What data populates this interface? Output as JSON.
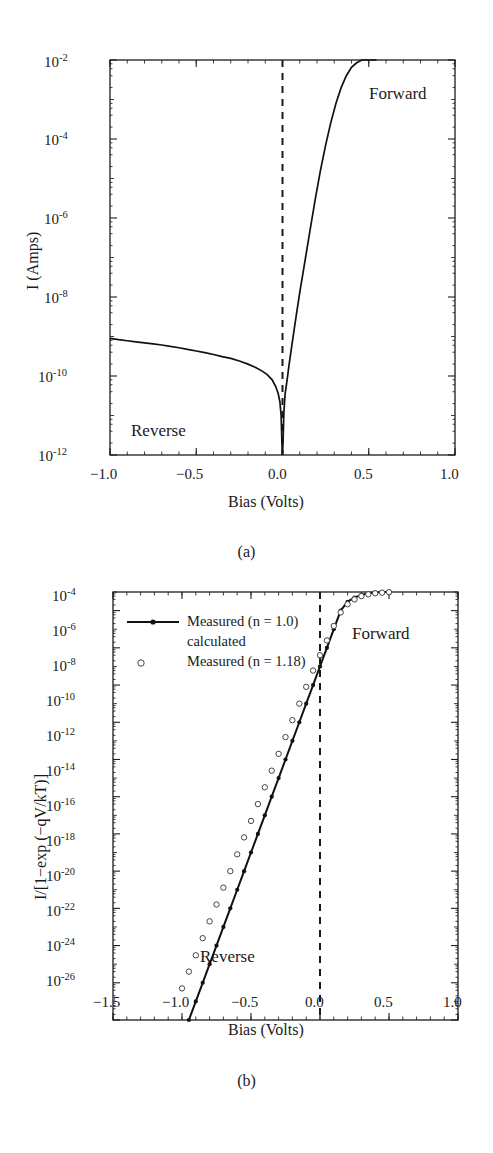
{
  "figure": {
    "panels": [
      {
        "caption": "(a)",
        "xlabel": "Bias (Volts)",
        "ylabel": "I (Amps)",
        "annotations": [
          {
            "name": "forward",
            "text": "Forward"
          },
          {
            "name": "reverse",
            "text": "Reverse"
          }
        ],
        "xticks": [
          "−1.0",
          "−0.5",
          "0.0",
          "0.5",
          "1.0"
        ],
        "yticks": [
          "-2",
          "-4",
          "-6",
          "-8",
          "-10",
          "-12"
        ],
        "ymantissa": "10"
      },
      {
        "caption": "(b)",
        "xlabel": "Bias (Volts)",
        "ylabel": "I/[1−exp (−qV/kT)]",
        "annotations": [
          {
            "name": "forward",
            "text": "Forward"
          },
          {
            "name": "reverse",
            "text": "Reverse"
          }
        ],
        "xticks": [
          "−1.5",
          "−1.0",
          "−0.5",
          "0.0",
          "0.5",
          "1.0"
        ],
        "yticks": [
          "-4",
          "-6",
          "-8",
          "-10",
          "-12",
          "-14",
          "-16",
          "-18",
          "-20",
          "-22",
          "-24",
          "-26"
        ],
        "ymantissa": "10",
        "legend": [
          {
            "marker": "line-with-dot",
            "text": "Measured (n = 1.0)",
            "continuation": "calculated"
          },
          {
            "marker": "open-circle",
            "text": "Measured (n = 1.18)"
          }
        ]
      }
    ]
  },
  "chart_data": [
    {
      "type": "line",
      "panel": "(a)",
      "title": "",
      "xlabel": "Bias (Volts)",
      "ylabel": "I (Amps)",
      "xlim": [
        -1.0,
        1.0
      ],
      "ylim": [
        1e-12,
        0.01
      ],
      "yscale": "log",
      "xticks": [
        -1.0,
        -0.5,
        0.0,
        0.5,
        1.0
      ],
      "yticks": [
        0.01,
        0.0001,
        1e-06,
        1e-08,
        1e-10,
        1e-12
      ],
      "grid": false,
      "legend_position": "none",
      "annotations": [
        {
          "text": "Forward",
          "x": 0.62,
          "y": 0.002
        },
        {
          "text": "Reverse",
          "x": -0.78,
          "y": 6e-12
        }
      ],
      "reference_lines": [
        {
          "orientation": "vertical",
          "x": 0.0,
          "style": "dashed"
        }
      ],
      "series": [
        {
          "name": "Reverse branch",
          "style": "solid-line",
          "x": [
            -1.0,
            -0.95,
            -0.9,
            -0.85,
            -0.8,
            -0.75,
            -0.7,
            -0.65,
            -0.6,
            -0.55,
            -0.5,
            -0.45,
            -0.4,
            -0.35,
            -0.3,
            -0.25,
            -0.2,
            -0.15,
            -0.12,
            -0.09,
            -0.06,
            -0.04,
            -0.025,
            -0.015,
            -0.008,
            -0.004,
            -0.001
          ],
          "y": [
            9e-10,
            8.3e-10,
            7.8e-10,
            7.3e-10,
            6.9e-10,
            6.5e-10,
            6.1e-10,
            5.6e-10,
            5.2e-10,
            4.7e-10,
            4.3e-10,
            3.9e-10,
            3.5e-10,
            3.1e-10,
            2.8e-10,
            2.4e-10,
            2e-10,
            1.6e-10,
            1.35e-10,
            1.1e-10,
            8e-11,
            5.5e-11,
            3.6e-11,
            2.2e-11,
            1e-11,
            2.5e-12,
            1e-12
          ]
        },
        {
          "name": "Forward branch",
          "style": "solid-line",
          "x": [
            0.0,
            0.004,
            0.008,
            0.015,
            0.025,
            0.04,
            0.06,
            0.08,
            0.1,
            0.13,
            0.16,
            0.19,
            0.22,
            0.25,
            0.28,
            0.31,
            0.34,
            0.37,
            0.4,
            0.43,
            0.46,
            0.49,
            0.52,
            0.545
          ],
          "y": [
            1e-12,
            3e-12,
            1.2e-11,
            3.5e-11,
            7e-11,
            2.2e-10,
            9e-10,
            3.5e-09,
            1.3e-08,
            8e-08,
            5e-07,
            3e-06,
            1.6e-05,
            7e-05,
            0.00026,
            0.0008,
            0.002,
            0.004,
            0.0065,
            0.0085,
            0.01,
            0.011,
            0.0115,
            0.012
          ]
        }
      ]
    },
    {
      "type": "scatter",
      "panel": "(b)",
      "title": "",
      "xlabel": "Bias (Volts)",
      "ylabel": "I/[1−exp (−qV/kT)]",
      "xlim": [
        -1.5,
        1.0
      ],
      "ylim": [
        1e-26,
        0.001
      ],
      "yscale": "log",
      "xticks": [
        -1.5,
        -1.0,
        -0.5,
        0.0,
        0.5,
        1.0
      ],
      "yticks": [
        0.0001,
        1e-06,
        1e-08,
        1e-10,
        1e-12,
        1e-14,
        1e-16,
        1e-18,
        1e-20,
        1e-22,
        1e-24,
        1e-26
      ],
      "grid": false,
      "legend_position": "upper-left",
      "annotations": [
        {
          "text": "Forward",
          "x": 0.42,
          "y": 1e-05
        },
        {
          "text": "Reverse",
          "x": -0.32,
          "y": 2e-25
        }
      ],
      "reference_lines": [
        {
          "orientation": "vertical",
          "x": 0.0,
          "style": "dashed"
        }
      ],
      "series": [
        {
          "name": "Measured (n = 1.0) calculated",
          "style": "line-with-filled-dots",
          "marker": "filled-circle",
          "x": [
            -0.95,
            -0.9,
            -0.85,
            -0.8,
            -0.75,
            -0.7,
            -0.65,
            -0.6,
            -0.55,
            -0.5,
            -0.45,
            -0.4,
            -0.35,
            -0.3,
            -0.25,
            -0.2,
            -0.15,
            -0.1,
            -0.05,
            0.0,
            0.05,
            0.1,
            0.15,
            0.2,
            0.25,
            0.3,
            0.35,
            0.4,
            0.45,
            0.5
          ],
          "y": [
            1e-26,
            1e-25,
            1e-24,
            1e-23,
            1e-22,
            1e-21,
            1e-20,
            1e-19,
            1e-18,
            1e-17,
            1e-16,
            1e-15,
            1e-14,
            1e-13,
            1e-12,
            1e-11,
            1e-10,
            1e-09,
            1e-08,
            1e-07,
            1e-06,
            1e-05,
            0.0001,
            0.0003,
            0.0005,
            0.0007,
            0.00085,
            0.00095,
            0.001,
            0.00105
          ]
        },
        {
          "name": "Measured (n = 1.18)",
          "style": "open-circles",
          "marker": "open-circle",
          "x": [
            -1.0,
            -0.95,
            -0.9,
            -0.85,
            -0.8,
            -0.75,
            -0.7,
            -0.65,
            -0.6,
            -0.55,
            -0.5,
            -0.45,
            -0.4,
            -0.35,
            -0.3,
            -0.25,
            -0.2,
            -0.15,
            -0.1,
            -0.05,
            0.0,
            0.05,
            0.1,
            0.15,
            0.2,
            0.25,
            0.3,
            0.35,
            0.4,
            0.45,
            0.5
          ],
          "y": [
            5e-25,
            4e-24,
            3e-23,
            2.5e-22,
            2e-21,
            1.6e-20,
            1.3e-19,
            1e-18,
            8e-18,
            6.5e-17,
            5e-16,
            4e-15,
            3.2e-14,
            2.5e-13,
            2e-12,
            1.6e-11,
            1.3e-10,
            1e-09,
            8e-09,
            6e-08,
            4e-07,
            2.5e-06,
            1.5e-05,
            8e-05,
            0.00022,
            0.0004,
            0.0006,
            0.00075,
            0.00085,
            0.00092,
            0.00098
          ]
        }
      ]
    }
  ]
}
